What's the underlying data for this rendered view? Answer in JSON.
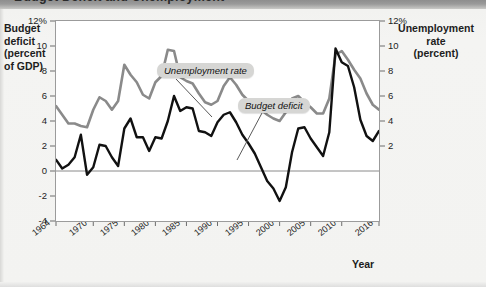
{
  "figure": {
    "title_partial": "Budget Deficit and Unemployment",
    "left_axis_title": "Budget\ndeficit\n(percent\nof GDP)",
    "right_axis_title": "Unemployment\nrate\n(percent)",
    "x_axis_title": "Year"
  },
  "callouts": {
    "unemployment": "Unemployment rate",
    "deficit": "Budget deficit"
  },
  "colors": {
    "unemployment_line": "#8a8a8a",
    "deficit_line": "#111111",
    "plot_background": "#ffffff",
    "frame": "#9b9b9b",
    "zero_line": "#8a8a8a",
    "callout_background": "#d6d6d4",
    "page_background": "#f3f3f1"
  },
  "axes": {
    "left": {
      "label": "Budget deficit (percent of GDP)",
      "ticks": [
        "12%",
        "10",
        "8",
        "6",
        "4",
        "2",
        "0",
        "-2",
        "-4"
      ],
      "values": [
        12,
        10,
        8,
        6,
        4,
        2,
        0,
        -2,
        -4
      ],
      "min": -4,
      "max": 12
    },
    "right": {
      "label": "Unemployment rate (percent)",
      "ticks": [
        "12%",
        "10",
        "8",
        "6",
        "4",
        "2"
      ],
      "values": [
        12,
        10,
        8,
        6,
        4,
        2
      ],
      "min": -4,
      "max": 12
    },
    "x": {
      "label": "Year",
      "ticks": [
        "1964",
        "1970",
        "1975",
        "1980",
        "1985",
        "1990",
        "1995",
        "2000",
        "2005",
        "2010",
        "2016"
      ],
      "values": [
        1964,
        1970,
        1975,
        1980,
        1985,
        1990,
        1995,
        2000,
        2005,
        2010,
        2016
      ],
      "min": 1964,
      "max": 2016
    }
  },
  "chart_data": {
    "type": "line",
    "title": "Budget Deficit and Unemployment",
    "xlabel": "Year",
    "ylabel": "Budget deficit (percent of GDP)",
    "y2label": "Unemployment rate (percent)",
    "xlim": [
      1964,
      2016
    ],
    "ylim": [
      -4,
      12
    ],
    "y2lim": [
      -4,
      12
    ],
    "grid": false,
    "legend": "inline-callouts",
    "x": [
      1964,
      1965,
      1966,
      1967,
      1968,
      1969,
      1970,
      1971,
      1972,
      1973,
      1974,
      1975,
      1976,
      1977,
      1978,
      1979,
      1980,
      1981,
      1982,
      1983,
      1984,
      1985,
      1986,
      1987,
      1988,
      1989,
      1990,
      1991,
      1992,
      1993,
      1994,
      1995,
      1996,
      1997,
      1998,
      1999,
      2000,
      2001,
      2002,
      2003,
      2004,
      2005,
      2006,
      2007,
      2008,
      2009,
      2010,
      2011,
      2012,
      2013,
      2014,
      2015,
      2016
    ],
    "series": [
      {
        "name": "Unemployment rate",
        "axis": "right",
        "color": "#8a8a8a",
        "values": [
          5.2,
          4.5,
          3.8,
          3.8,
          3.6,
          3.5,
          4.9,
          5.9,
          5.6,
          4.9,
          5.6,
          8.5,
          7.7,
          7.1,
          6.1,
          5.8,
          7.1,
          7.6,
          9.7,
          9.6,
          7.5,
          7.2,
          7.0,
          6.2,
          5.5,
          5.3,
          5.6,
          6.8,
          7.5,
          6.9,
          6.1,
          5.6,
          5.4,
          4.9,
          4.5,
          4.2,
          4.0,
          4.7,
          5.8,
          6.0,
          5.5,
          5.1,
          4.6,
          4.6,
          5.8,
          9.3,
          9.6,
          8.9,
          8.1,
          7.4,
          6.2,
          5.3,
          4.9
        ]
      },
      {
        "name": "Budget deficit",
        "axis": "left",
        "color": "#111111",
        "values": [
          0.9,
          0.2,
          0.5,
          1.1,
          2.9,
          -0.3,
          0.3,
          2.1,
          2.0,
          1.1,
          0.4,
          3.4,
          4.2,
          2.7,
          2.7,
          1.6,
          2.7,
          2.6,
          4.0,
          6.0,
          4.8,
          5.1,
          5.0,
          3.2,
          3.1,
          2.8,
          3.9,
          4.5,
          4.7,
          3.9,
          2.9,
          2.2,
          1.4,
          0.3,
          -0.8,
          -1.4,
          -2.4,
          -1.3,
          1.5,
          3.4,
          3.5,
          2.6,
          1.9,
          1.2,
          3.1,
          9.8,
          8.7,
          8.4,
          6.7,
          4.1,
          2.8,
          2.4,
          3.2
        ]
      }
    ]
  }
}
